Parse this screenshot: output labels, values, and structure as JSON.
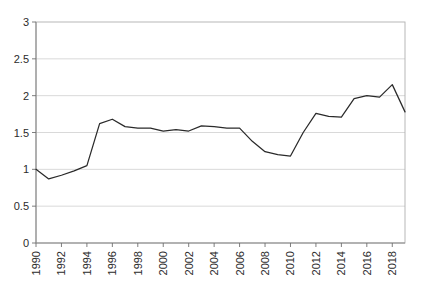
{
  "chart_data": {
    "type": "line",
    "title": "",
    "subtitle": "",
    "xlabel": "",
    "ylabel": "",
    "grid": "horizontal",
    "legend": "none",
    "xlim": [
      1990,
      2019
    ],
    "ylim": [
      0,
      3
    ],
    "ytick_labels": [
      "0",
      "0.5",
      "1",
      "1.5",
      "2",
      "2.5",
      "3"
    ],
    "ytick_values": [
      0,
      0.5,
      1,
      1.5,
      2,
      2.5,
      3
    ],
    "xtick_labels": [
      "1990",
      "1992",
      "1994",
      "1996",
      "1998",
      "2000",
      "2002",
      "2004",
      "2006",
      "2008",
      "2010",
      "2012",
      "2014",
      "2016",
      "2018"
    ],
    "xtick_values": [
      1990,
      1992,
      1994,
      1996,
      1998,
      2000,
      2002,
      2004,
      2006,
      2008,
      2010,
      2012,
      2014,
      2016,
      2018
    ],
    "xtick_rotation": 90,
    "x": [
      1990,
      1991,
      1992,
      1993,
      1994,
      1995,
      1996,
      1997,
      1998,
      1999,
      2000,
      2001,
      2002,
      2003,
      2004,
      2005,
      2006,
      2007,
      2008,
      2009,
      2010,
      2011,
      2012,
      2013,
      2014,
      2015,
      2016,
      2017,
      2018,
      2019
    ],
    "values": [
      1.0,
      0.87,
      0.92,
      0.98,
      1.05,
      1.62,
      1.68,
      1.58,
      1.56,
      1.56,
      1.52,
      1.54,
      1.52,
      1.59,
      1.58,
      1.56,
      1.56,
      1.38,
      1.24,
      1.2,
      1.18,
      1.5,
      1.76,
      1.72,
      1.71,
      1.96,
      2.0,
      1.98,
      2.15,
      1.78
    ],
    "series": [
      {
        "name": "series-1",
        "color": "#2a2a2a",
        "values": [
          1.0,
          0.87,
          0.92,
          0.98,
          1.05,
          1.62,
          1.68,
          1.58,
          1.56,
          1.56,
          1.52,
          1.54,
          1.52,
          1.59,
          1.58,
          1.56,
          1.56,
          1.38,
          1.24,
          1.2,
          1.18,
          1.5,
          1.76,
          1.72,
          1.71,
          1.96,
          2.0,
          1.98,
          2.15,
          1.78
        ]
      }
    ],
    "annotations": []
  },
  "colors": {
    "background": "#ffffff",
    "line": "#2a2a2a",
    "grid": "#c8c8c8",
    "axis": "#8a8a8a",
    "border": "#b0b0b0",
    "tick_text": "#2b2b2b"
  },
  "geometry": {
    "plot_left": 36,
    "plot_right": 405,
    "plot_top": 22,
    "plot_bottom": 243
  }
}
